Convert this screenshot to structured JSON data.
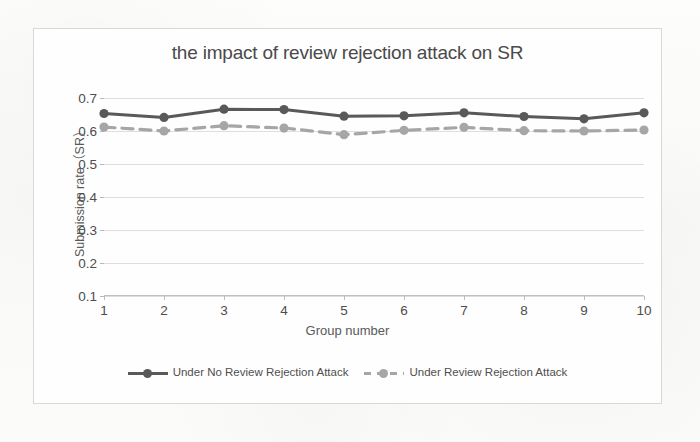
{
  "chart_data": {
    "type": "line",
    "title": "the impact of review rejection attack on SR",
    "xlabel": "Group number",
    "ylabel": "Submission rate（SR）",
    "x": [
      1,
      2,
      3,
      4,
      5,
      6,
      7,
      8,
      9,
      10
    ],
    "xtick_labels": [
      "1",
      "2",
      "3",
      "4",
      "5",
      "6",
      "7",
      "8",
      "9",
      "10"
    ],
    "ytick_labels": [
      "0.1",
      "0.2",
      "0.3",
      "0.4",
      "0.5",
      "0.6",
      "0.7"
    ],
    "yticks": [
      0.1,
      0.2,
      0.3,
      0.4,
      0.5,
      0.6,
      0.7
    ],
    "ylim": [
      0.0,
      0.7
    ],
    "xlim": [
      1,
      10
    ],
    "grid": true,
    "legend_position": "bottom",
    "series": [
      {
        "name": "Under No Review Rejection Attack",
        "values": [
          0.653,
          0.641,
          0.666,
          0.665,
          0.645,
          0.646,
          0.655,
          0.644,
          0.637,
          0.655
        ],
        "color": "#595959",
        "style": "solid",
        "marker": "circle"
      },
      {
        "name": "Under Review Rejection Attack",
        "values": [
          0.612,
          0.6,
          0.616,
          0.609,
          0.589,
          0.602,
          0.611,
          0.601,
          0.6,
          0.603
        ],
        "color": "#a6a6a6",
        "style": "dashed",
        "marker": "circle"
      }
    ]
  },
  "legend": {
    "entries": [
      {
        "label": "Under No Review Rejection Attack"
      },
      {
        "label": "Under Review Rejection Attack"
      }
    ]
  }
}
